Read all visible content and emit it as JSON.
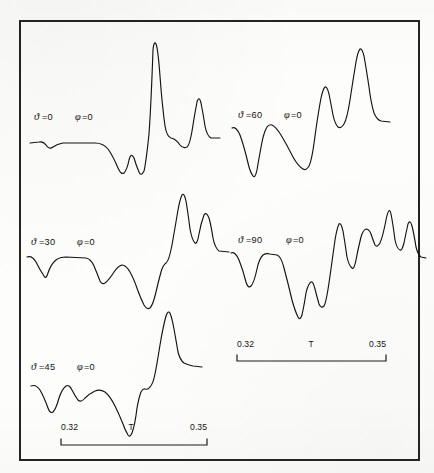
{
  "figure": {
    "kind": "multi-trace-spectrum",
    "background_color": "#fdfdfc",
    "ink_color": "#15130f",
    "frame": {
      "x": 20,
      "y": 21,
      "width": 399,
      "height": 439,
      "visible": true
    }
  },
  "panels": [
    {
      "id": "panel-theta-0",
      "theta_symbol": "ϑ",
      "theta_label": "=0",
      "phi_symbol": "φ",
      "phi_label": "=0",
      "label_x": 34,
      "label_y": 120
    },
    {
      "id": "panel-theta-30",
      "theta_symbol": "ϑ",
      "theta_label": "=30",
      "phi_symbol": "φ",
      "phi_label": "=0",
      "label_x": 31,
      "label_y": 245
    },
    {
      "id": "panel-theta-45",
      "theta_symbol": "ϑ",
      "theta_label": "=45",
      "phi_symbol": "φ",
      "phi_label": "=0",
      "label_x": 31,
      "label_y": 370
    },
    {
      "id": "panel-theta-60",
      "theta_symbol": "ϑ",
      "theta_label": "=60",
      "phi_symbol": "φ",
      "phi_label": "=0",
      "label_x": 238,
      "label_y": 118
    },
    {
      "id": "panel-theta-90",
      "theta_symbol": "ϑ",
      "theta_label": "=90",
      "phi_symbol": "φ",
      "phi_label": "=0",
      "label_x": 238,
      "label_y": 243
    }
  ],
  "axes": [
    {
      "id": "axis-left",
      "min_label": "0.32",
      "variable_label": "T",
      "max_label": "0.35",
      "min_x": 61,
      "max_x": 207,
      "text_y": 430,
      "rule_y": 445,
      "tick_height": 6
    },
    {
      "id": "axis-right",
      "min_label": "0.32",
      "variable_label": "T",
      "max_label": "0.35",
      "min_x": 237,
      "max_x": 386,
      "text_y": 347,
      "rule_y": 361,
      "tick_height": 6
    }
  ],
  "chart_data": {
    "type": "line",
    "title": "",
    "xlabel": "T",
    "ylabel": "",
    "xlim": [
      0.32,
      0.35
    ],
    "grid": false,
    "legend_position": "inline-left-of-each-trace",
    "annotations": [
      "ϑ=0  φ=0",
      "ϑ=30  φ=0",
      "ϑ=45  φ=0",
      "ϑ=60  φ=0",
      "ϑ=90  φ=0"
    ],
    "series": [
      {
        "name": "ϑ=0, φ=0",
        "path": "M 30 143 L 39 142 Q 43 141 46 145 Q 49 150 53 147 Q 57 144 63 143 L 95 143 Q 103 143 108 149 Q 113 156 118 168 Q 121 175 124 173 Q 127 170 129 160 Q 131 152 134 158 Q 136 165 139 172 Q 141 177 144 171 Q 146 163 149 134 Q 151 106 153 50 Q 154 40 156 44 Q 158 49 160 76 Q 162 104 165 126 Q 167 137 171 138 Q 176 139 180 145 Q 183 149 187 147 Q 190 145 193 125 Q 195 112 197 102 Q 199 95 201 103 Q 203 113 205 126 Q 207 136 211 138 L 220 138"
      },
      {
        "name": "ϑ=30, φ=0",
        "path": "M 27 257 Q 32 255 36 262 Q 40 270 44 276 Q 46 280 48 273 Q 51 264 56 260 Q 60 257 66 257 L 86 258 Q 91 259 94 266 Q 97 273 100 281 Q 102 285 105 283 Q 109 280 114 272 Q 118 266 122 265 Q 126 265 130 272 Q 134 279 138 291 Q 141 299 144 305 Q 147 310 150 308 Q 153 305 156 292 Q 158 283 161 272 Q 163 265 166 263 Q 169 261 172 245 Q 175 228 178 210 Q 180 199 182 195 Q 184 192 186 201 Q 188 213 190 229 Q 192 240 195 243 Q 197 245 199 234 Q 201 223 204 215 Q 206 211 209 218 Q 211 225 213 238 Q 215 248 219 251 L 229 252"
      },
      {
        "name": "ϑ=45, φ=0",
        "path": "M 31 386 Q 36 384 40 390 Q 44 397 48 408 Q 50 414 53 412 Q 56 409 59 398 Q 62 389 66 386 Q 69 384 72 390 Q 75 396 78 400 Q 81 403 85 398 Q 89 394 95 391 Q 100 389 105 392 Q 110 396 115 406 Q 119 414 123 424 Q 125 430 128 435 Q 130 438 132 433 Q 135 425 137 408 Q 139 397 141 392 Q 143 388 145 389 Q 148 390 150 387 Q 153 384 155 374 Q 157 364 160 345 Q 163 327 166 316 Q 168 310 170 313 Q 172 318 174 329 Q 176 340 178 352 Q 180 360 184 363 Q 188 365 193 366 L 202 367"
      },
      {
        "name": "ϑ=60, φ=0",
        "path": "M 232 128 Q 236 126 240 135 Q 244 146 248 163 Q 250 172 253 176 Q 255 179 257 170 Q 259 158 262 142 Q 264 132 267 127 Q 269 124 272 125 Q 276 127 281 135 Q 287 145 293 157 Q 298 166 303 169 Q 306 171 309 166 Q 312 160 315 136 Q 318 114 321 98 Q 323 89 325 87 Q 327 86 329 94 Q 331 104 333 115 Q 335 124 338 127 Q 341 129 344 124 Q 347 119 350 100 Q 353 80 356 62 Q 358 51 360 49 Q 362 48 364 56 Q 366 67 369 87 Q 371 103 374 113 Q 377 120 381 121 L 390 122"
      },
      {
        "name": "ϑ=90, φ=0",
        "path": "M 231 253 Q 235 251 239 260 Q 243 270 246 282 Q 248 289 251 286 Q 254 283 257 269 Q 259 259 263 255 Q 266 253 270 254 L 277 255 Q 281 256 284 268 Q 288 283 292 300 Q 295 311 298 317 Q 300 321 302 315 Q 304 306 306 293 Q 308 284 311 282 Q 313 281 315 289 Q 317 297 319 304 Q 321 309 324 306 Q 326 303 329 283 Q 332 262 335 240 Q 337 228 339 224 Q 341 222 343 231 Q 345 243 347 257 Q 349 266 352 268 Q 354 270 356 260 Q 358 249 361 237 Q 363 230 366 229 Q 369 229 371 234 Q 373 240 375 245 Q 377 248 380 243 Q 383 236 386 220 Q 389 205 391 214 Q 393 224 395 240 Q 397 249 400 250 Q 402 251 404 243 Q 406 233 408 224 Q 410 219 412 226 Q 414 234 416 247 Q 418 255 421 257 L 426 258"
      }
    ]
  }
}
